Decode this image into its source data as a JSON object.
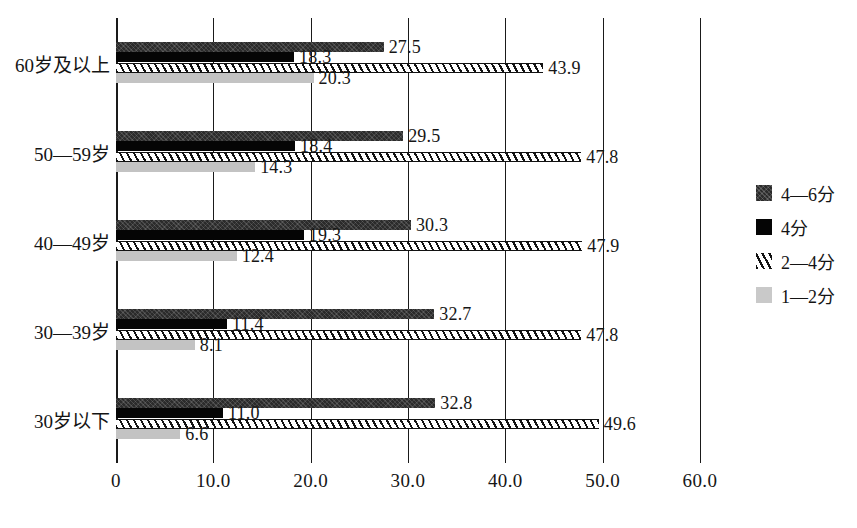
{
  "chart_data": {
    "type": "bar",
    "orientation": "horizontal",
    "title": "",
    "subtitle": "",
    "xlabel": "",
    "ylabel": "",
    "xlim": [
      0,
      60
    ],
    "xticks": [
      "0",
      "10.0",
      "20.0",
      "30.0",
      "40.0",
      "50.0",
      "60.0"
    ],
    "xtick_values": [
      0,
      10,
      20,
      30,
      40,
      50,
      60
    ],
    "grid": "vertical",
    "legend_position": "right",
    "categories": [
      "60岁及以上",
      "50—59岁",
      "40—49岁",
      "30—39岁",
      "30岁以下"
    ],
    "series": [
      {
        "name": "4—6分",
        "style": "dark-speckled",
        "color": "#2b2b2b",
        "values": [
          27.5,
          29.5,
          30.3,
          32.7,
          32.8
        ],
        "labels": [
          "27.5",
          "29.5",
          "30.3",
          "32.7",
          "32.8"
        ]
      },
      {
        "name": "4分",
        "style": "solid-black",
        "color": "#050505",
        "values": [
          18.3,
          18.4,
          19.3,
          11.4,
          11.0
        ],
        "labels": [
          "18.3",
          "18.4",
          "19.3",
          "11.4",
          "11.0"
        ]
      },
      {
        "name": "2—4分",
        "style": "hatched",
        "color": "#121212",
        "values": [
          43.9,
          47.8,
          47.9,
          47.8,
          49.6
        ],
        "labels": [
          "43.9",
          "47.8",
          "47.9",
          "47.8",
          "49.6"
        ]
      },
      {
        "name": "1—2分",
        "style": "light-gray",
        "color": "#c3c3c3",
        "values": [
          20.3,
          14.3,
          12.4,
          8.1,
          6.6
        ],
        "labels": [
          "20.3",
          "14.3",
          "12.4",
          "8.1",
          "6.6"
        ]
      }
    ]
  },
  "legend": {
    "items": [
      {
        "label": "4—6分"
      },
      {
        "label": "4分"
      },
      {
        "label": "2—4分"
      },
      {
        "label": "1—2分"
      }
    ]
  }
}
